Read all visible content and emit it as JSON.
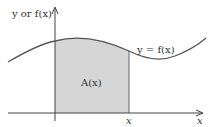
{
  "diagram": {
    "y_axis_label": "y or f(x)",
    "curve_label": "y = f(x)",
    "area_label": "A(x)",
    "x_tick_label": "x",
    "x_axis_label": "x",
    "colors": {
      "curve": "#555555",
      "axes": "#444444",
      "shaded_area": "#d6d6d6",
      "text": "#333333"
    }
  }
}
